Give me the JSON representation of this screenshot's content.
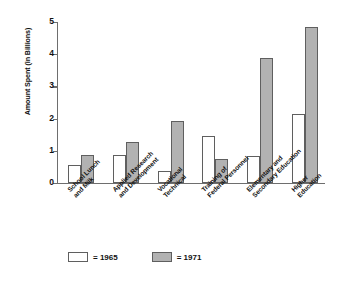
{
  "chart_data": {
    "type": "bar",
    "title": "",
    "xlabel": "",
    "ylabel": "Amount Spent (in Billions)",
    "ylim": [
      0,
      5
    ],
    "yticks": [
      "0",
      "1",
      "2",
      "3",
      "4",
      "5"
    ],
    "grid": false,
    "legend_position": "bottom-left",
    "categories": [
      "School Lunch and Milk",
      "Applied Research and Development",
      "Vocational Technical",
      "Training of Federal Personnel",
      "Elementary and Secondary Education",
      "Higher Education"
    ],
    "category_lines": [
      [
        "School Lunch",
        "and Milk"
      ],
      [
        "Applied Research",
        "and Development"
      ],
      [
        "Vocational",
        "Technical"
      ],
      [
        "Training of",
        "Federal Personnel"
      ],
      [
        "Elementary and",
        "Secondary Education"
      ],
      [
        "Higher",
        "Education"
      ]
    ],
    "series": [
      {
        "name": "1965",
        "legend_label": "= 1965",
        "color": "#ffffff",
        "values": [
          0.55,
          0.88,
          0.37,
          1.47,
          0.83,
          2.13
        ]
      },
      {
        "name": "1971",
        "legend_label": "= 1971",
        "color": "#b2b2b2",
        "values": [
          0.86,
          1.27,
          1.93,
          0.75,
          3.88,
          4.85
        ]
      }
    ]
  }
}
